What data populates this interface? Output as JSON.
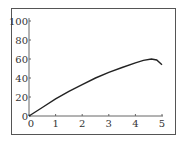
{
  "chart_data": {
    "type": "line",
    "title": "",
    "xlabel": "",
    "ylabel": "",
    "xlim": [
      0,
      5
    ],
    "ylim": [
      0,
      100
    ],
    "grid": false,
    "legend": null,
    "x_ticks": [
      "0",
      "1",
      "2",
      "3",
      "4",
      "5"
    ],
    "y_ticks": [
      "0",
      "20",
      "40",
      "60",
      "80",
      "100"
    ],
    "series": [
      {
        "name": "curve",
        "color": "#222222",
        "x": [
          0,
          0.5,
          1,
          1.5,
          2,
          2.5,
          3,
          3.5,
          4,
          4.3,
          4.6,
          4.8,
          5
        ],
        "y": [
          0,
          9,
          18,
          26,
          33,
          40,
          46,
          51,
          56,
          58.5,
          60,
          59,
          54
        ]
      }
    ]
  }
}
